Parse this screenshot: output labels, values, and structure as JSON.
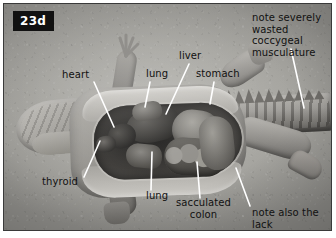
{
  "figure": {
    "badge": "23d",
    "caption_type": "anatomical-photograph",
    "colors": {
      "badge_bg": "#111111",
      "badge_text": "#ffffff",
      "label_text": "#111111",
      "leader_line": "#ffffff",
      "plate_border": "#3a3a3a",
      "background": "#ffffff"
    }
  },
  "annotations": [
    {
      "id": "heart",
      "text": "heart",
      "x": 58,
      "y": 71,
      "align": "left",
      "lines": 1
    },
    {
      "id": "lung_top",
      "text": "lung",
      "x": 142,
      "y": 70,
      "align": "left",
      "lines": 1
    },
    {
      "id": "liver",
      "text": "liver",
      "x": 175,
      "y": 52,
      "align": "left",
      "lines": 1
    },
    {
      "id": "stomach",
      "text": "stomach",
      "x": 192,
      "y": 70,
      "align": "left",
      "lines": 1
    },
    {
      "id": "coccygeal",
      "text": "note severely\nwasted coccygeal\nmusculature",
      "x": 248,
      "y": 10,
      "align": "left",
      "lines": 3
    },
    {
      "id": "thyroid",
      "text": "thyroid",
      "x": 42,
      "y": 177,
      "align": "left",
      "lines": 1
    },
    {
      "id": "lung_bot",
      "text": "lung",
      "x": 142,
      "y": 189,
      "align": "left",
      "lines": 1
    },
    {
      "id": "colon",
      "text": "sacculated\ncolon",
      "x": 172,
      "y": 197,
      "align": "left",
      "lines": 2
    },
    {
      "id": "coelomic",
      "text": "note also the lack\nof coelomic fat",
      "x": 248,
      "y": 206,
      "align": "left",
      "lines": 2
    }
  ],
  "leaders": [
    {
      "id": "heart-leader",
      "x1": 90,
      "y1": 78,
      "x2": 110,
      "y2": 123
    },
    {
      "id": "lung-top-leader",
      "x1": 146,
      "y1": 78,
      "x2": 141,
      "y2": 103
    },
    {
      "id": "liver-leader",
      "x1": 185,
      "y1": 60,
      "x2": 162,
      "y2": 110
    },
    {
      "id": "stomach-leader",
      "x1": 210,
      "y1": 78,
      "x2": 206,
      "y2": 100
    },
    {
      "id": "coccygeal-leader",
      "x1": 287,
      "y1": 45,
      "x2": 300,
      "y2": 104
    },
    {
      "id": "thyroid-leader",
      "x1": 80,
      "y1": 173,
      "x2": 96,
      "y2": 137
    },
    {
      "id": "lung-bot-leader",
      "x1": 147,
      "y1": 186,
      "x2": 148,
      "y2": 148
    },
    {
      "id": "colon-leader",
      "x1": 196,
      "y1": 194,
      "x2": 193,
      "y2": 158
    },
    {
      "id": "coelomic-leader",
      "x1": 246,
      "y1": 202,
      "x2": 232,
      "y2": 164
    }
  ]
}
